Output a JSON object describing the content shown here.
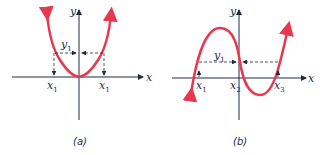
{
  "colors": {
    "curve": "#e8384f",
    "axis": "#1f2a44",
    "dash": "#1f2a44"
  },
  "panel_a": {
    "caption": "(a)",
    "y_axis_label": "y",
    "x_axis_label": "x",
    "y1_label": "y",
    "y1_sub": "1",
    "x1_left_label": "x",
    "x1_left_sub": "1",
    "x1_right_label": "x",
    "x1_right_sub": "1"
  },
  "panel_b": {
    "caption": "(b)",
    "y_axis_label": "y",
    "x_axis_label": "x",
    "y1_label": "y",
    "y1_sub": "1",
    "x1_label": "x",
    "x1_sub": "1",
    "x2_label": "x",
    "x2_sub": "2",
    "x3_label": "x",
    "x3_sub": "3"
  }
}
